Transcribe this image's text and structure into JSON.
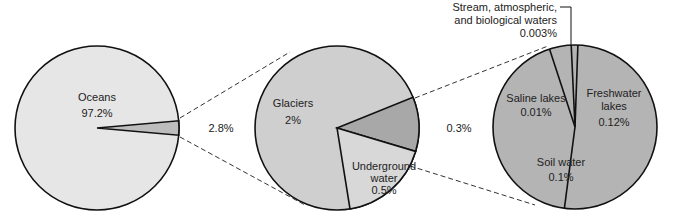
{
  "chart_data": {
    "type": "pie",
    "title": "",
    "pies": [
      {
        "name": "total-water",
        "slices": [
          {
            "label": "Oceans",
            "value": 97.2,
            "display": "97.2%",
            "color": "#e6e6e6"
          },
          {
            "label": "",
            "value": 2.8,
            "display": "",
            "color": "#bdbdbd"
          }
        ],
        "callout": "2.8%"
      },
      {
        "name": "non-ocean-water",
        "slices": [
          {
            "label": "Glaciers",
            "value": 2.0,
            "display": "2%",
            "color": "#cfcfcf"
          },
          {
            "label": "",
            "value": 0.3,
            "display": "",
            "color": "#a8a8a8"
          },
          {
            "label": "Underground water",
            "value": 0.5,
            "display": "0.5%",
            "color": "#d8d8d8"
          }
        ],
        "callout": "0.3%"
      },
      {
        "name": "surface-and-other-water",
        "slices": [
          {
            "label": "Freshwater lakes",
            "value": 0.12,
            "display": "0.12%",
            "color": "#b4b4b4"
          },
          {
            "label": "Soil water",
            "value": 0.1,
            "display": "0.1%",
            "color": "#b4b4b4"
          },
          {
            "label": "Saline lakes",
            "value": 0.01,
            "display": "0.01%",
            "color": "#b4b4b4"
          },
          {
            "label": "Stream, atmospheric, and biological waters",
            "value": 0.003,
            "display": "0.003%",
            "color": "#b4b4b4"
          }
        ]
      }
    ]
  },
  "labels": {
    "oceans": "Oceans",
    "oceans_pct": "97.2%",
    "callout1": "2.8%",
    "glaciers": "Glaciers",
    "glaciers_pct": "2%",
    "underground1": "Underground",
    "underground2": "water",
    "underground_pct": "0.5%",
    "callout2": "0.3%",
    "saline": "Saline lakes",
    "saline_pct": "0.01%",
    "fresh1": "Freshwater",
    "fresh2": "lakes",
    "fresh_pct": "0.12%",
    "soil": "Soil water",
    "soil_pct": "0.1%",
    "stream1": "Stream, atmospheric,",
    "stream2": "and biological waters",
    "stream_pct": "0.003%"
  }
}
